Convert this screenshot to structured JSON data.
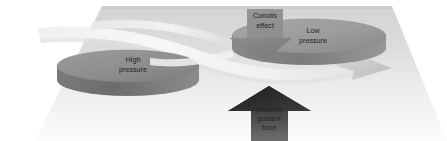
{
  "figure": {
    "background_color": "#ffffff",
    "ground_plane": {
      "name": "ground-plane",
      "fill_top": "#d2d2d2",
      "fill_bottom": "#fbfbfb"
    }
  },
  "labels": {
    "high_pressure": {
      "line1": "High",
      "line2": "pressure"
    },
    "low_pressure": {
      "line1": "Low",
      "line2": "pressure"
    },
    "coriolis": {
      "line1": "Coriolis",
      "line2": "effect"
    },
    "gradient_force": {
      "line1": "pressure",
      "line2": "gradient",
      "line3": "force"
    }
  },
  "elements": {
    "high_pressure_disc": {
      "name": "high-pressure-cylinder",
      "top_fill": "#8e8e8e",
      "side_fill": "#6f6f6f"
    },
    "low_pressure_disc": {
      "name": "low-pressure-cylinder",
      "top_fill": "#9b9b9b",
      "side_fill": "#7d7d7d"
    },
    "wind_ribbon": {
      "name": "wind-flow-ribbon",
      "fill": "#f3f3f3",
      "arrow_fill": "#c9c9c9"
    },
    "coriolis_arrow": {
      "name": "coriolis-effect-arrow",
      "fill": "#8a8a8a"
    },
    "gradient_arrow": {
      "name": "pressure-gradient-force-arrow",
      "fill_top": "#2b2b2b",
      "fill_bottom": "#6a6a6a"
    }
  }
}
